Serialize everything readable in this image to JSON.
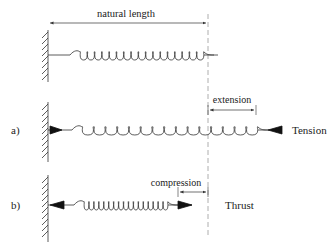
{
  "diagram": {
    "labels": {
      "natural_length": "natural length",
      "extension": "extension",
      "compression": "compression",
      "tension": "Tension",
      "thrust": "Thrust",
      "case_a": "a)",
      "case_b": "b)"
    },
    "springs": [
      {
        "name": "natural",
        "coils": 17
      },
      {
        "name": "extended",
        "coils": 15
      },
      {
        "name": "compressed",
        "coils": 17
      }
    ],
    "colors": {
      "line": "#333333",
      "background": "#ffffff",
      "dashed": "#999999"
    }
  }
}
